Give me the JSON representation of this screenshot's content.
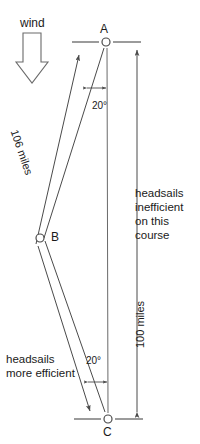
{
  "diagram": {
    "wind": {
      "label": "wind",
      "icon": "block-arrow-down-icon",
      "direction": "down"
    },
    "points": [
      {
        "id": "A",
        "label": "A",
        "x": 106,
        "y": 42,
        "has_horizon_ticks": true
      },
      {
        "id": "B",
        "label": "B",
        "x": 40,
        "y": 238,
        "has_horizon_ticks": false
      },
      {
        "id": "C",
        "label": "C",
        "x": 108,
        "y": 419,
        "has_horizon_ticks": true
      }
    ],
    "angles": [
      {
        "id": "angle-at-A",
        "label": "20°",
        "value": 20,
        "unit": "degrees"
      },
      {
        "id": "angle-at-C",
        "label": "20°",
        "value": 20,
        "unit": "degrees"
      }
    ],
    "distances": [
      {
        "id": "leg-total",
        "label": "106 miles",
        "value": 106,
        "unit": "miles",
        "along": "A-B-C"
      },
      {
        "id": "rhumb-line",
        "label": "100 miles",
        "value": 100,
        "unit": "miles",
        "along": "A-C"
      }
    ],
    "notes": [
      {
        "id": "note-inefficient",
        "text": "headsails inefficient on this course"
      },
      {
        "id": "note-efficient",
        "text": "headsails more efficient"
      }
    ],
    "colors": {
      "line": "#4a4a4a",
      "text": "#1a1a1a",
      "background": "#ffffff"
    }
  }
}
